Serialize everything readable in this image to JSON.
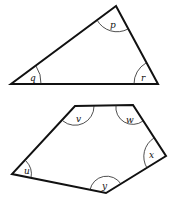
{
  "figure": {
    "width": 177,
    "height": 201,
    "background": "#ffffff",
    "stroke_color": "#111111"
  },
  "triangle": {
    "vertices": [
      [
        116,
        6
      ],
      [
        11,
        84
      ],
      [
        158,
        84
      ]
    ],
    "angles": [
      {
        "label": "p",
        "vertex": [
          116,
          6
        ],
        "label_pos": [
          112,
          26
        ]
      },
      {
        "label": "q",
        "vertex": [
          11,
          84
        ],
        "label_pos": [
          30,
          79
        ]
      },
      {
        "label": "r",
        "vertex": [
          158,
          84
        ],
        "label_pos": [
          141,
          79
        ]
      }
    ]
  },
  "pentagon": {
    "vertices": [
      [
        75,
        106
      ],
      [
        133,
        105
      ],
      [
        166,
        156
      ],
      [
        106,
        193
      ],
      [
        12,
        174
      ]
    ],
    "angles": [
      {
        "label": "v",
        "vertex": [
          75,
          106
        ],
        "label_pos": [
          76,
          120
        ]
      },
      {
        "label": "w",
        "vertex": [
          133,
          105
        ],
        "label_pos": [
          126,
          122
        ]
      },
      {
        "label": "x",
        "vertex": [
          166,
          156
        ],
        "label_pos": [
          150,
          156
        ]
      },
      {
        "label": "y",
        "vertex": [
          106,
          193
        ],
        "label_pos": [
          102,
          187
        ]
      },
      {
        "label": "u",
        "vertex": [
          12,
          174
        ],
        "label_pos": [
          25,
          172
        ]
      }
    ]
  }
}
